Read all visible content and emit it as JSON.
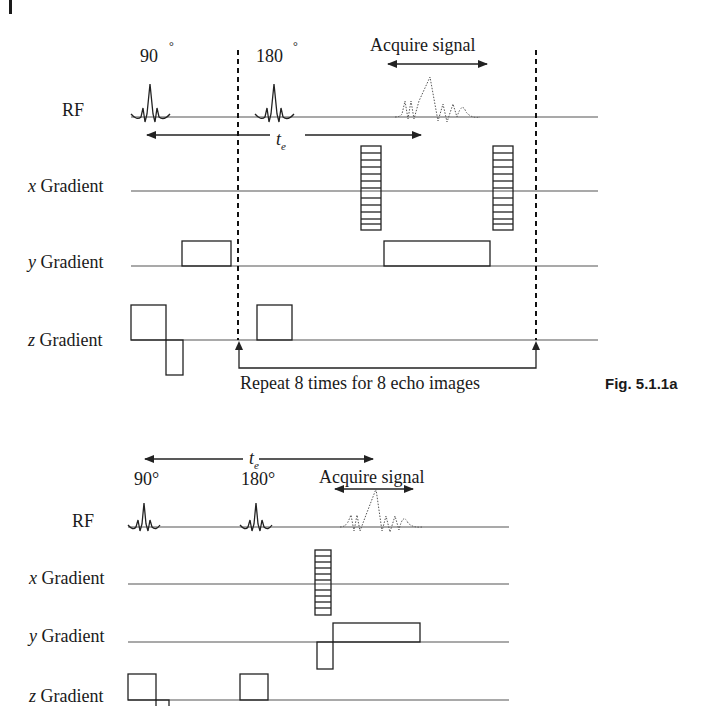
{
  "running_head": {
    "text": "5  Reactors and Reactions"
  },
  "figure_a": {
    "caption": "Fig. 5.1.1a",
    "row_labels": {
      "rf": "RF",
      "x_prefix": "x",
      "x_suffix": " Gradient",
      "y_prefix": "y",
      "y_suffix": " Gradient",
      "z_prefix": "z",
      "z_suffix": " Gradient"
    },
    "pulse_labels": {
      "p90": "90",
      "p180": "180",
      "degree": "°"
    },
    "echo_time": {
      "t": "t",
      "sub": "e"
    },
    "acquire_label": "Acquire signal",
    "repeat_label": "Repeat 8 times for 8 echo images"
  },
  "figure_b": {
    "row_labels": {
      "rf": "RF",
      "x_prefix": "x",
      "x_suffix": " Gradient",
      "y_prefix": "y",
      "y_suffix": " Gradient",
      "z_prefix": "z",
      "z_suffix": " Gradient"
    },
    "pulse_labels": {
      "p90": "90°",
      "p180": "180°"
    },
    "echo_time": {
      "t": "t",
      "sub": "e"
    },
    "acquire_label": "Acquire signal"
  }
}
